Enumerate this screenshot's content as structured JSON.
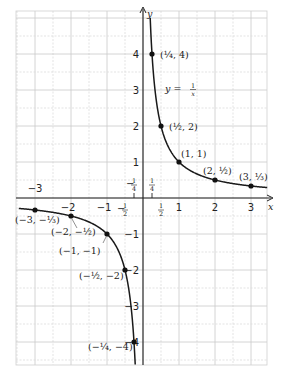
{
  "chart_data": {
    "type": "line",
    "title": "",
    "equation_label": "y = 1/x",
    "xlabel": "x",
    "ylabel": "y",
    "xlim": [
      -3.5,
      3.5
    ],
    "ylim": [
      -4.6,
      5.2
    ],
    "grid": true,
    "grid_step": 0.5,
    "x_ticks": [
      {
        "value": -3,
        "label": "−3"
      },
      {
        "value": -2,
        "label": "−2"
      },
      {
        "value": -1,
        "label": "−1"
      },
      {
        "value": -0.5,
        "label": "−½"
      },
      {
        "value": -0.25,
        "label": "−¼"
      },
      {
        "value": 0.25,
        "label": "¼"
      },
      {
        "value": 0.5,
        "label": "½"
      },
      {
        "value": 1,
        "label": "1"
      },
      {
        "value": 2,
        "label": "2"
      },
      {
        "value": 3,
        "label": "3"
      }
    ],
    "y_ticks": [
      {
        "value": 4,
        "label": "4"
      },
      {
        "value": 3,
        "label": "3"
      },
      {
        "value": 2,
        "label": "2"
      },
      {
        "value": 1,
        "label": "1"
      },
      {
        "value": -1,
        "label": "−1"
      },
      {
        "value": -2,
        "label": "−2"
      },
      {
        "value": -3,
        "label": "−3"
      },
      {
        "value": -4,
        "label": "−4"
      }
    ],
    "series": [
      {
        "name": "y = 1/x",
        "function": "1/x",
        "points": [
          {
            "x": 0.25,
            "y": 4,
            "label": "(¼, 4)"
          },
          {
            "x": 0.5,
            "y": 2,
            "label": "(½, 2)"
          },
          {
            "x": 1,
            "y": 1,
            "label": "(1, 1)"
          },
          {
            "x": 2,
            "y": 0.5,
            "label": "(2, ½)"
          },
          {
            "x": 3,
            "y": 0.3333,
            "label": "(3, ⅓)"
          },
          {
            "x": -3,
            "y": -0.3333,
            "label": "(−3, −⅓)"
          },
          {
            "x": -2,
            "y": -0.5,
            "label": "(−2, −½)"
          },
          {
            "x": -1,
            "y": -1,
            "label": "(−1, −1)"
          },
          {
            "x": -0.5,
            "y": -2,
            "label": "(−½, −2)"
          },
          {
            "x": -0.25,
            "y": -4,
            "label": "(−¼, −4)"
          }
        ]
      }
    ]
  },
  "axes": {
    "x_label": "x",
    "y_label": "y"
  },
  "equation": {
    "prefix": "y = ",
    "num": "1",
    "den": "x"
  }
}
